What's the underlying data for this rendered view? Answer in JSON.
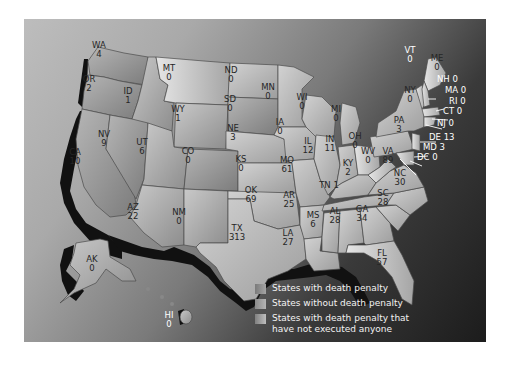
{
  "map": {
    "title": "",
    "colors": {
      "frame_light": "#bdbdbd",
      "frame_dark": "#1c1c1c",
      "state_with_penalty": "#9a9a9a",
      "state_without_penalty": "#b8b8b8",
      "state_no_executions": "#a5a5a5",
      "coast_shadow": "#111111",
      "label_text": "#262626",
      "leader_text": "#ffffff"
    },
    "states": [
      {
        "abbr": "WA",
        "value": "4"
      },
      {
        "abbr": "OR",
        "value": "2"
      },
      {
        "abbr": "CA",
        "value": "10"
      },
      {
        "abbr": "ID",
        "value": "1"
      },
      {
        "abbr": "NV",
        "value": "9"
      },
      {
        "abbr": "MT",
        "value": "0"
      },
      {
        "abbr": "WY",
        "value": "1"
      },
      {
        "abbr": "UT",
        "value": "6"
      },
      {
        "abbr": "AZ",
        "value": "22"
      },
      {
        "abbr": "CO",
        "value": "0"
      },
      {
        "abbr": "NM",
        "value": "0"
      },
      {
        "abbr": "ND",
        "value": "0"
      },
      {
        "abbr": "SD",
        "value": "0"
      },
      {
        "abbr": "NE",
        "value": "3"
      },
      {
        "abbr": "KS",
        "value": "0"
      },
      {
        "abbr": "OK",
        "value": "69"
      },
      {
        "abbr": "TX",
        "value": "313"
      },
      {
        "abbr": "MN",
        "value": "0"
      },
      {
        "abbr": "IA",
        "value": "0"
      },
      {
        "abbr": "MO",
        "value": "61"
      },
      {
        "abbr": "AR",
        "value": "25"
      },
      {
        "abbr": "LA",
        "value": "27"
      },
      {
        "abbr": "WI",
        "value": "0"
      },
      {
        "abbr": "IL",
        "value": "12"
      },
      {
        "abbr": "MI",
        "value": "0"
      },
      {
        "abbr": "IN",
        "value": "11"
      },
      {
        "abbr": "OH",
        "value": "0"
      },
      {
        "abbr": "KY",
        "value": "2"
      },
      {
        "abbr": "TN",
        "value": "1"
      },
      {
        "abbr": "MS",
        "value": "6"
      },
      {
        "abbr": "AL",
        "value": "28"
      },
      {
        "abbr": "GA",
        "value": "34"
      },
      {
        "abbr": "FL",
        "value": "57"
      },
      {
        "abbr": "SC",
        "value": "28"
      },
      {
        "abbr": "NC",
        "value": "30"
      },
      {
        "abbr": "VA",
        "value": "89"
      },
      {
        "abbr": "WV",
        "value": "0"
      },
      {
        "abbr": "PA",
        "value": "3"
      },
      {
        "abbr": "NY",
        "value": "0"
      },
      {
        "abbr": "VT",
        "value": "0"
      },
      {
        "abbr": "ME",
        "value": "0"
      },
      {
        "abbr": "NH",
        "value": "0"
      },
      {
        "abbr": "MA",
        "value": "0"
      },
      {
        "abbr": "RI",
        "value": "0"
      },
      {
        "abbr": "CT",
        "value": "0"
      },
      {
        "abbr": "NJ",
        "value": "0"
      },
      {
        "abbr": "DE",
        "value": "13"
      },
      {
        "abbr": "MD",
        "value": "3"
      },
      {
        "abbr": "DC",
        "value": "0"
      },
      {
        "abbr": "AK",
        "value": "0"
      },
      {
        "abbr": "HI",
        "value": "0"
      }
    ],
    "labels": {
      "WA": "WA\n4",
      "TN": "TN 1",
      "NH": "NH 0",
      "MA": "MA 0",
      "RI": "RI 0",
      "CT": "CT 0",
      "NJ": "NJ 0",
      "DE": "DE 13",
      "MD": "MD 3",
      "DC": "DC 0"
    },
    "legend": [
      {
        "label": "States with death penalty",
        "swatch": "#8e8e8e"
      },
      {
        "label": "States without death penalty",
        "swatch": "#a8a8a8"
      },
      {
        "label": "States with death penalty that have not executed anyone",
        "line1": "States with death penalty that",
        "line2": "have not executed anyone",
        "swatch": "#9a9a9a"
      }
    ]
  }
}
